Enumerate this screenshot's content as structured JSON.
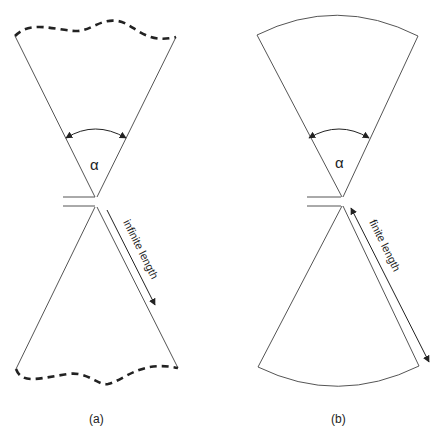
{
  "figure": {
    "panels": [
      {
        "id": "a",
        "caption": "(a)",
        "angle_symbol": "α",
        "length_label": "infinite length",
        "boundary_style": "dashed-wavy"
      },
      {
        "id": "b",
        "caption": "(b)",
        "angle_symbol": "α",
        "length_label": "finite length",
        "boundary_style": "arc"
      }
    ],
    "colors": {
      "line": "#333333",
      "background": "#ffffff"
    }
  }
}
